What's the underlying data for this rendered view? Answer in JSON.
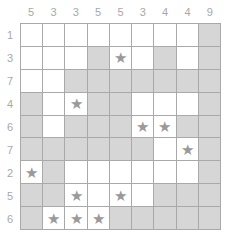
{
  "puzzle": {
    "column_clues": [
      "5",
      "3",
      "3",
      "5",
      "5",
      "3",
      "4",
      "4",
      "9"
    ],
    "row_clues": [
      "1",
      "3",
      "7",
      "4",
      "6",
      "7",
      "2",
      "5",
      "6"
    ],
    "star_glyph": "★",
    "colors": {
      "shaded": "#d6d6d6",
      "empty": "#ffffff",
      "star": "#9a9a9a",
      "gridline": "#a9a9a9",
      "clue_text": "#a8a8a8"
    },
    "cells": [
      [
        "w",
        "w",
        "w",
        "w",
        "w",
        "w",
        "w",
        "w",
        "g"
      ],
      [
        "w",
        "w",
        "w",
        "g",
        "s",
        "w",
        "g",
        "w",
        "g"
      ],
      [
        "w",
        "w",
        "g",
        "g",
        "g",
        "g",
        "g",
        "g",
        "g"
      ],
      [
        "g",
        "w",
        "s",
        "g",
        "g",
        "w",
        "w",
        "w",
        "g"
      ],
      [
        "g",
        "w",
        "g",
        "g",
        "g",
        "s",
        "s",
        "g",
        "g"
      ],
      [
        "g",
        "g",
        "g",
        "g",
        "g",
        "g",
        "w",
        "s",
        "g"
      ],
      [
        "s",
        "g",
        "w",
        "w",
        "w",
        "w",
        "w",
        "w",
        "g"
      ],
      [
        "g",
        "g",
        "s",
        "w",
        "s",
        "w",
        "g",
        "g",
        "g"
      ],
      [
        "g",
        "s",
        "s",
        "s",
        "g",
        "g",
        "g",
        "g",
        "g"
      ]
    ]
  }
}
